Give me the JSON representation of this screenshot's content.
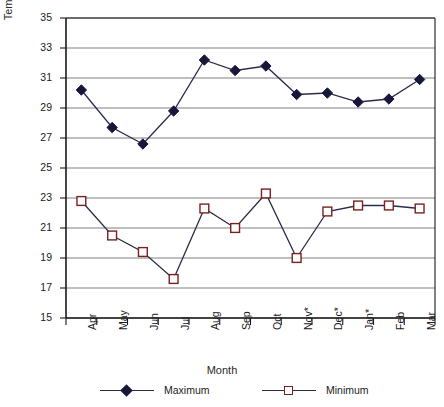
{
  "chart_data": {
    "type": "line",
    "title": "",
    "xlabel": "Month",
    "ylabel": "Temperature (°C)",
    "ylim": [
      15,
      35
    ],
    "yticks": [
      15,
      17,
      19,
      21,
      23,
      25,
      27,
      29,
      31,
      33,
      35
    ],
    "grid": true,
    "legend_position": "bottom",
    "categories": [
      "Apr",
      "May",
      "Jun",
      "Jul",
      "Aug",
      "Sep",
      "Oct",
      "Nov*",
      "Dec*",
      "Jan*",
      "Feb",
      "Mar"
    ],
    "series": [
      {
        "name": "Maximum",
        "marker": "filled-diamond",
        "color": "#17173a",
        "values": [
          30.2,
          27.7,
          26.6,
          28.8,
          32.2,
          31.5,
          31.8,
          29.9,
          30.0,
          29.4,
          29.6,
          30.9
        ]
      },
      {
        "name": "Minimum",
        "marker": "open-square",
        "color": "#7a2020",
        "values": [
          22.8,
          20.5,
          19.4,
          17.6,
          22.3,
          21.0,
          23.3,
          19.0,
          22.1,
          22.5,
          22.5,
          22.3
        ]
      }
    ]
  },
  "legend": {
    "items": [
      {
        "label": "Maximum"
      },
      {
        "label": "Minimum"
      }
    ]
  },
  "axes": {
    "y_title": "Temperature (°C)",
    "x_title": "Month"
  }
}
